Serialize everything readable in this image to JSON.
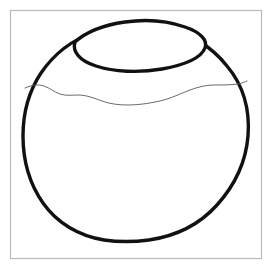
{
  "figure": {
    "kind": "line-drawing",
    "canvas": {
      "width": 273,
      "height": 274,
      "background": "#ffffff"
    },
    "frame": {
      "name": "figure-frame",
      "x": 10.5,
      "y": 10.5,
      "width": 251,
      "height": 248,
      "stroke": "#b9b9b9",
      "stroke_width": 1.2
    },
    "body": {
      "name": "vessel-body-outline",
      "stroke": "#111111",
      "stroke_width": 3.4,
      "bounds": {
        "left": 23,
        "right": 249,
        "top": 17,
        "bottom": 242
      },
      "path": "M 93 33 C 72 40 54 54 41 73 C 29 91 23 113 23 136 C 23 160 29 183 43 203 C 57 223 79 236 104 240 C 118 242 134 242 149 240 C 176 236 200 224 217 205 C 235 185 246 161 248 136 C 250 110 243 85 227 66 C 211 46 189 33 165 27 C 150 23 134 22 119 25 C 110 27 101 30 93 33 Z"
    },
    "rim": {
      "name": "vessel-rim-ellipse",
      "stroke": "#111111",
      "stroke_width": 3.4,
      "path": "M 75 42 C 86 32 104 25 125 22 C 146 19 168 21 185 27 C 200 32 208 40 205 48 C 201 58 184 65 162 69 C 139 73 114 72 96 66 C 80 61 72 52 75 42 Z"
    },
    "fill_line": {
      "name": "content-level-line",
      "stroke": "#5a5a5a",
      "stroke_width": 0.9,
      "path": "M 25 88 C 32 85 38 84 44 86 C 50 88 54 92 60 94 C 66 96 72 95 78 95 C 86 95 94 98 102 101 C 110 104 119 105 128 105 C 140 105 152 103 164 100 C 174 97 182 93 190 90 C 198 87 206 85 214 85 C 222 85 230 85 238 84 C 242 83 245 82 247 81"
    },
    "stipple": {
      "name": "stipple-fill",
      "color": "#7d7d8a",
      "dot_radius": 0.85,
      "count": 118,
      "points": [
        [
          44,
          108
        ],
        [
          62,
          104
        ],
        [
          78,
          100
        ],
        [
          96,
          110
        ],
        [
          112,
          104
        ],
        [
          130,
          112
        ],
        [
          148,
          108
        ],
        [
          166,
          104
        ],
        [
          184,
          100
        ],
        [
          202,
          98
        ],
        [
          220,
          94
        ],
        [
          236,
          92
        ],
        [
          36,
          120
        ],
        [
          54,
          116
        ],
        [
          70,
          124
        ],
        [
          88,
          118
        ],
        [
          106,
          126
        ],
        [
          124,
          120
        ],
        [
          142,
          128
        ],
        [
          160,
          122
        ],
        [
          178,
          118
        ],
        [
          196,
          124
        ],
        [
          214,
          112
        ],
        [
          232,
          108
        ],
        [
          30,
          134
        ],
        [
          48,
          130
        ],
        [
          66,
          138
        ],
        [
          84,
          132
        ],
        [
          102,
          140
        ],
        [
          120,
          134
        ],
        [
          138,
          142
        ],
        [
          156,
          136
        ],
        [
          174,
          132
        ],
        [
          192,
          140
        ],
        [
          210,
          128
        ],
        [
          228,
          124
        ],
        [
          244,
          120
        ],
        [
          34,
          148
        ],
        [
          52,
          144
        ],
        [
          70,
          152
        ],
        [
          88,
          146
        ],
        [
          106,
          154
        ],
        [
          124,
          148
        ],
        [
          142,
          156
        ],
        [
          160,
          150
        ],
        [
          178,
          146
        ],
        [
          196,
          154
        ],
        [
          214,
          142
        ],
        [
          232,
          138
        ],
        [
          246,
          134
        ],
        [
          30,
          162
        ],
        [
          48,
          158
        ],
        [
          66,
          166
        ],
        [
          84,
          160
        ],
        [
          102,
          168
        ],
        [
          120,
          162
        ],
        [
          138,
          170
        ],
        [
          156,
          164
        ],
        [
          174,
          160
        ],
        [
          192,
          168
        ],
        [
          210,
          156
        ],
        [
          228,
          152
        ],
        [
          242,
          148
        ],
        [
          36,
          176
        ],
        [
          54,
          172
        ],
        [
          72,
          180
        ],
        [
          90,
          174
        ],
        [
          108,
          182
        ],
        [
          126,
          176
        ],
        [
          144,
          184
        ],
        [
          162,
          178
        ],
        [
          180,
          174
        ],
        [
          198,
          182
        ],
        [
          216,
          170
        ],
        [
          232,
          166
        ],
        [
          44,
          190
        ],
        [
          62,
          186
        ],
        [
          80,
          194
        ],
        [
          98,
          188
        ],
        [
          116,
          196
        ],
        [
          134,
          190
        ],
        [
          152,
          198
        ],
        [
          170,
          192
        ],
        [
          188,
          188
        ],
        [
          206,
          194
        ],
        [
          222,
          182
        ],
        [
          54,
          204
        ],
        [
          72,
          200
        ],
        [
          90,
          208
        ],
        [
          108,
          202
        ],
        [
          126,
          210
        ],
        [
          144,
          204
        ],
        [
          162,
          212
        ],
        [
          180,
          206
        ],
        [
          198,
          200
        ],
        [
          212,
          206
        ],
        [
          68,
          218
        ],
        [
          86,
          214
        ],
        [
          104,
          222
        ],
        [
          122,
          216
        ],
        [
          140,
          224
        ],
        [
          158,
          218
        ],
        [
          176,
          212
        ],
        [
          192,
          218
        ],
        [
          88,
          230
        ],
        [
          106,
          226
        ],
        [
          124,
          232
        ],
        [
          142,
          228
        ],
        [
          160,
          230
        ],
        [
          178,
          224
        ],
        [
          58,
          112
        ],
        [
          146,
          94
        ],
        [
          204,
          110
        ],
        [
          40,
          160
        ],
        [
          240,
          160
        ],
        [
          100,
          236
        ],
        [
          148,
          236
        ],
        [
          120,
          150
        ],
        [
          166,
          148
        ],
        [
          74,
          140
        ]
      ]
    }
  }
}
